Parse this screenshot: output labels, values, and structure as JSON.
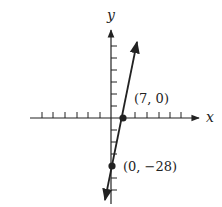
{
  "figure": {
    "type": "coordinate-graph",
    "axes": {
      "x_label": "x",
      "y_label": "y",
      "x_ticks_left": 6,
      "x_ticks_right": 5,
      "y_ticks_above": 6,
      "y_ticks_below": 5
    },
    "line": {
      "description": "line through (0, -28) and (7, 0)",
      "slope": 4,
      "y_intercept": -28,
      "x_intercept": 7
    },
    "points": [
      {
        "label": "(7, 0)",
        "x": 7,
        "y": 0
      },
      {
        "label": "(0, −28)",
        "x": 0,
        "y": -28
      }
    ],
    "colors": {
      "ink": "#222222",
      "background": "#ffffff"
    }
  }
}
